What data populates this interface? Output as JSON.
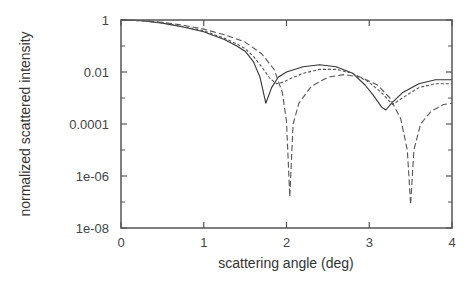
{
  "chart_data": {
    "type": "line",
    "title": "",
    "xlabel": "scattering angle (deg)",
    "ylabel": "normalized scattered intensity",
    "xlim": [
      0,
      4
    ],
    "ylim": [
      1e-08,
      1
    ],
    "yscale": "log",
    "grid": false,
    "legend": null,
    "x_ticks": [
      {
        "value": 0,
        "label": "0"
      },
      {
        "value": 1,
        "label": "1"
      },
      {
        "value": 2,
        "label": "2"
      },
      {
        "value": 3,
        "label": "3"
      },
      {
        "value": 4,
        "label": "4"
      }
    ],
    "y_ticks": [
      {
        "value": 0,
        "label": "1"
      },
      {
        "value": -2,
        "label": "0.01"
      },
      {
        "value": -4,
        "label": "0.0001"
      },
      {
        "value": -6,
        "label": "1e-06"
      },
      {
        "value": -8,
        "label": "1e-08"
      }
    ],
    "y_minor_ticks": [
      -1,
      -3,
      -5,
      -7
    ],
    "series": [
      {
        "name": "solid",
        "style": "solid",
        "color": "#333333",
        "x": [
          0,
          0.25,
          0.5,
          0.75,
          1.0,
          1.25,
          1.4,
          1.5,
          1.6,
          1.68,
          1.75,
          1.82,
          1.9,
          2.0,
          2.2,
          2.4,
          2.6,
          2.8,
          2.95,
          3.05,
          3.15,
          3.2,
          3.27,
          3.4,
          3.6,
          3.8,
          4.0
        ],
        "log10y": [
          0,
          -0.03,
          -0.12,
          -0.27,
          -0.45,
          -0.75,
          -1.0,
          -1.2,
          -1.6,
          -2.2,
          -3.2,
          -2.6,
          -2.2,
          -2.0,
          -1.8,
          -1.72,
          -1.8,
          -2.05,
          -2.5,
          -2.9,
          -3.35,
          -3.46,
          -3.2,
          -2.8,
          -2.45,
          -2.3,
          -2.3
        ]
      },
      {
        "name": "short-dash",
        "style": "dotted",
        "color": "#555555",
        "x": [
          0,
          0.25,
          0.5,
          0.75,
          1.0,
          1.25,
          1.4,
          1.5,
          1.6,
          1.7,
          1.8,
          1.88,
          1.95,
          2.05,
          2.2,
          2.4,
          2.6,
          2.8,
          3.0,
          3.15,
          3.28,
          3.4,
          3.5,
          3.6,
          3.8,
          4.0
        ],
        "log10y": [
          0,
          -0.03,
          -0.11,
          -0.25,
          -0.42,
          -0.7,
          -0.92,
          -1.1,
          -1.4,
          -1.8,
          -2.25,
          -2.45,
          -2.4,
          -2.25,
          -2.05,
          -1.9,
          -1.9,
          -2.05,
          -2.4,
          -2.8,
          -3.25,
          -3.0,
          -2.8,
          -2.6,
          -2.45,
          -2.45
        ]
      },
      {
        "name": "long-dash",
        "style": "dashed",
        "color": "#555555",
        "x": [
          0,
          0.25,
          0.5,
          0.75,
          1.0,
          1.25,
          1.5,
          1.7,
          1.85,
          1.95,
          2.0,
          2.04,
          2.08,
          2.15,
          2.3,
          2.5,
          2.7,
          2.9,
          3.1,
          3.25,
          3.38,
          3.46,
          3.5,
          3.54,
          3.62,
          3.75,
          3.9,
          4.0
        ],
        "log10y": [
          0,
          -0.02,
          -0.09,
          -0.2,
          -0.35,
          -0.57,
          -0.85,
          -1.3,
          -1.9,
          -2.8,
          -3.9,
          -6.8,
          -4.0,
          -3.2,
          -2.55,
          -2.2,
          -2.1,
          -2.2,
          -2.5,
          -3.0,
          -3.8,
          -5.0,
          -7.1,
          -5.0,
          -4.0,
          -3.5,
          -3.25,
          -3.2
        ]
      }
    ]
  }
}
